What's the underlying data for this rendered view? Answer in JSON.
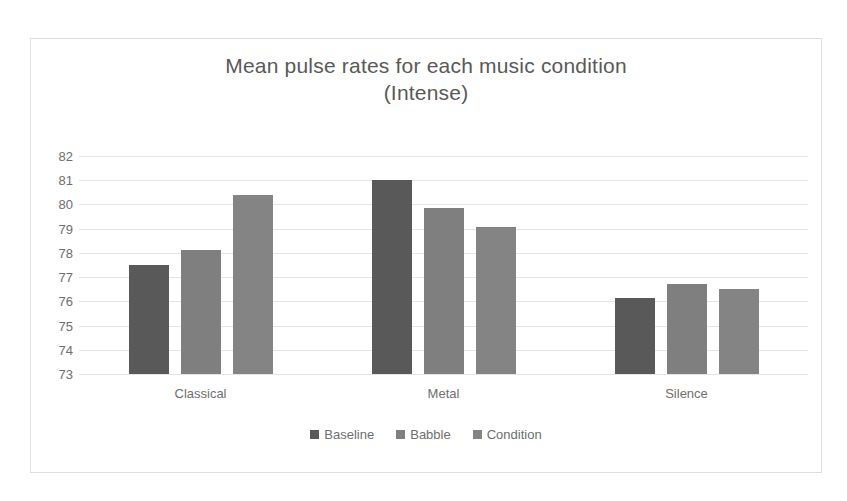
{
  "chart_data": {
    "type": "bar",
    "title": "Mean pulse rates for each music condition",
    "subtitle": "(Intense)",
    "title_line1": "Mean pulse rates for each music condition",
    "title_line2": "(Intense)",
    "xlabel": "",
    "ylabel": "",
    "categories": [
      "Classical",
      "Metal",
      "Silence"
    ],
    "ylim": [
      73,
      82
    ],
    "ytick_labels": [
      "82",
      "81",
      "80",
      "79",
      "78",
      "77",
      "76",
      "75",
      "74",
      "73"
    ],
    "yticks": [
      82,
      81,
      80,
      79,
      78,
      77,
      76,
      75,
      74,
      73
    ],
    "grid": true,
    "legend_position": "bottom",
    "series": [
      {
        "name": "Baseline",
        "color": "#595959",
        "values": [
          77.5,
          81.0,
          76.15
        ]
      },
      {
        "name": "Babble",
        "color": "#7f7f7f",
        "values": [
          78.1,
          79.85,
          76.7
        ]
      },
      {
        "name": "Condition",
        "color": "#848484",
        "values": [
          80.4,
          79.05,
          76.5
        ]
      }
    ]
  },
  "colors": {
    "baseline": "#595959",
    "babble": "#7f7f7f",
    "condition": "#848484",
    "gridline": "#e4e4e4",
    "text": "#6e6e6e",
    "title": "#595959",
    "border": "#dedede",
    "background": "#ffffff"
  }
}
